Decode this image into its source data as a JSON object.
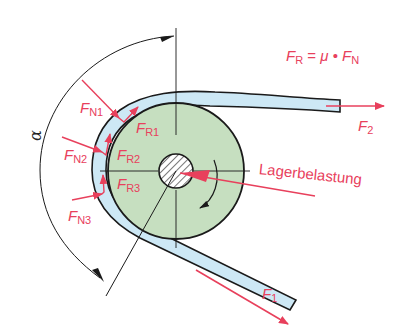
{
  "diagram": {
    "formula": {
      "lhs_symbol": "F",
      "lhs_sub": "R",
      "equals": "=",
      "mu": "μ",
      "dot": "•",
      "rhs_symbol": "F",
      "rhs_sub": "N"
    },
    "angle_label": "α",
    "bearing_load_label": "Lagerbelastung",
    "forces": {
      "fn1": {
        "symbol": "F",
        "sub": "N1"
      },
      "fn2": {
        "symbol": "F",
        "sub": "N2"
      },
      "fn3": {
        "symbol": "F",
        "sub": "N3"
      },
      "fr1": {
        "symbol": "F",
        "sub": "R1"
      },
      "fr2": {
        "symbol": "F",
        "sub": "R2"
      },
      "fr3": {
        "symbol": "F",
        "sub": "R3"
      },
      "f1": {
        "symbol": "F",
        "sub": "1"
      },
      "f2": {
        "symbol": "F",
        "sub": "2"
      }
    },
    "colors": {
      "force": "#e8405c",
      "belt": "#cde8f5",
      "pulley": "#c6dfc0",
      "outline": "#1a1a1a",
      "background": "#ffffff"
    }
  }
}
